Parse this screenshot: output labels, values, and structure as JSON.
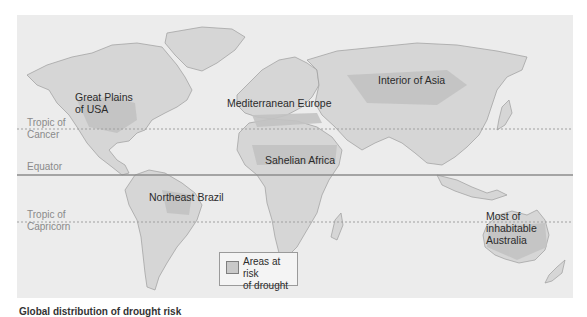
{
  "map": {
    "title": "World map: areas at risk of drought",
    "colors": {
      "background": "#ececec",
      "land": "#d6d6d6",
      "risk_area": "#c3c3c3",
      "border": "#9c9c9c",
      "equator_line": "#8c8c8c",
      "tropic_line": "#a0a0a0"
    },
    "latitude_lines": [
      {
        "label": "Tropic of\nCancer",
        "line1": "Tropic of",
        "line2": "Cancer",
        "style": "dashed"
      },
      {
        "label": "Equator",
        "style": "solid"
      },
      {
        "label": "Tropic of\nCapricorn",
        "line1": "Tropic of",
        "line2": "Capricorn",
        "style": "dashed"
      }
    ],
    "regions": [
      {
        "name": "great-plains-usa",
        "line1": "Great Plains",
        "line2": "of USA"
      },
      {
        "name": "mediterranean-europe",
        "line1": "Mediterranean Europe"
      },
      {
        "name": "interior-of-asia",
        "line1": "Interior of Asia"
      },
      {
        "name": "sahelian-africa",
        "line1": "Sahelian Africa"
      },
      {
        "name": "northeast-brazil",
        "line1": "Northeast Brazil"
      },
      {
        "name": "inhabitable-australia",
        "line1": "Most of",
        "line2": "inhabitable",
        "line3": "Australia"
      }
    ],
    "legend": {
      "line1": "Areas at risk",
      "line2": "of drought"
    }
  },
  "caption": "Global distribution of drought risk"
}
